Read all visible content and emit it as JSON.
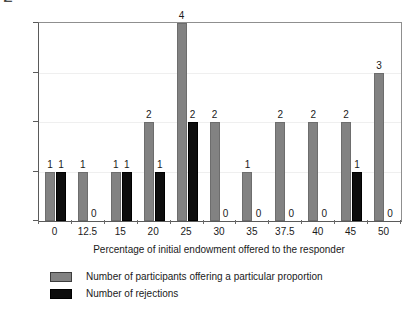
{
  "chart_data": {
    "type": "bar",
    "title": "",
    "subtitle": "",
    "xlabel": "Percentage of initial endowment offered to the responder",
    "ylabel": "Number of participants",
    "categories": [
      "0",
      "12.5",
      "15",
      "20",
      "25",
      "30",
      "35",
      "37.5",
      "40",
      "45",
      "50"
    ],
    "series": [
      {
        "name": "Number of participants offering a particular proportion",
        "color": "#828282",
        "values": [
          1,
          1,
          1,
          2,
          4,
          2,
          1,
          2,
          2,
          2,
          3
        ],
        "labels": [
          "1",
          "1",
          "1",
          "2",
          "4",
          "2",
          "1",
          "2",
          "2",
          "2",
          "3"
        ]
      },
      {
        "name": "Number of rejections",
        "color": "#0d0d0d",
        "values": [
          1,
          0,
          1,
          1,
          2,
          0,
          0,
          0,
          0,
          1,
          0
        ],
        "labels": [
          "1",
          "0",
          "1",
          "1",
          "2",
          "0",
          "0",
          "0",
          "0",
          "1",
          "0"
        ]
      }
    ],
    "ylim": [
      0,
      4
    ],
    "yticks": [
      0,
      1,
      2,
      3,
      4
    ],
    "ytick_labels": [
      "0",
      "1",
      "2",
      "3",
      "4"
    ],
    "grid": true,
    "grid_color": "#efefef",
    "legend_position": "bottom",
    "data_labels": true
  },
  "legend": {
    "items": [
      {
        "label": "Number of participants offering a particular proportion",
        "swatch": "gray"
      },
      {
        "label": "Number of rejections",
        "swatch": "black"
      }
    ]
  },
  "colors": {
    "series_gray": "#828282",
    "series_black": "#0d0d0d",
    "axis": "#5a5a5a",
    "grid": "#efefef",
    "background": "#ffffff",
    "text": "#1a1a1a"
  }
}
